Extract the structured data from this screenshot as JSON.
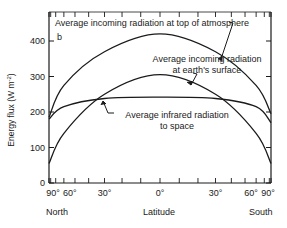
{
  "chart_data": {
    "type": "line",
    "title": "",
    "panel_label": "b",
    "xlabel": "Latitude",
    "ylabel": "Energy flux (W m-2)",
    "ylabel_parts": {
      "main": "Energy flux  (W  m",
      "sup": "-2",
      "close": ")"
    },
    "x_direction_labels": {
      "left": "North",
      "right": "South"
    },
    "x_scale": "sine of latitude (area-weighted)",
    "x_ticks": [
      {
        "lat": -90,
        "label": "90°"
      },
      {
        "lat": -60,
        "label": "60°"
      },
      {
        "lat": -30,
        "label": "30°"
      },
      {
        "lat": 0,
        "label": "0°"
      },
      {
        "lat": 30,
        "label": "30°"
      },
      {
        "lat": 60,
        "label": "60°"
      },
      {
        "lat": 90,
        "label": "90°"
      }
    ],
    "y_ticks": [
      0,
      100,
      200,
      300,
      400
    ],
    "ylim": [
      0,
      450
    ],
    "x": [
      -90,
      -60,
      -30,
      0,
      30,
      60,
      90
    ],
    "series": [
      {
        "name": "Average incoming radiation at top of atmosphere",
        "values": [
          185,
          275,
          370,
          420,
          370,
          275,
          195
        ]
      },
      {
        "name": "Average incoming radiation at earth's surface",
        "values": [
          55,
          140,
          250,
          305,
          250,
          140,
          55
        ]
      },
      {
        "name": "Average infrared radiation to space",
        "values": [
          180,
          215,
          238,
          242,
          238,
          215,
          170
        ]
      }
    ],
    "annotations": [
      {
        "text_lines": [
          "Average incoming radiation at top of atmosphere"
        ],
        "points_to": "series.0"
      },
      {
        "text_lines": [
          "Average incoming radiation",
          "at earth's surface"
        ],
        "points_to": "series.1"
      },
      {
        "text_lines": [
          "Average infrared radiation",
          "to space"
        ],
        "points_to": "series.2"
      }
    ],
    "grid": false,
    "legend": "none (inline annotations)"
  }
}
